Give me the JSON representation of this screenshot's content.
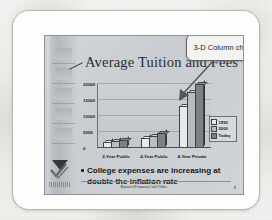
{
  "slide": {
    "title": "Average Tuition and Fees",
    "callout_label": "3-D Column chart",
    "bullet": "College expenses are increasing at double the inflation rate",
    "footer": "Bursar's/Financial Aid Office",
    "slide_number": "3",
    "logo_caption": "XYZ0001"
  },
  "colors": {
    "slide_bg": "#cdd0d4",
    "series_1993": "#e8e9ea",
    "series_2000": "#b9bcc0",
    "series_today": "#7d8084",
    "outline": "#3e4144",
    "frame_border": "#b9b7b3"
  },
  "chart_data": {
    "type": "bar",
    "title": "Average Tuition and Fees",
    "xlabel": "",
    "ylabel": "",
    "categories": [
      "2-Year Public",
      "4-Year Public",
      "4-Year Private"
    ],
    "series": [
      {
        "name": "1993",
        "values": [
          1100,
          2400,
          12500
        ]
      },
      {
        "name": "2000",
        "values": [
          1600,
          3200,
          17000
        ]
      },
      {
        "name": "Today",
        "values": [
          1900,
          4000,
          19500
        ]
      }
    ],
    "ylim": [
      0,
      20000
    ],
    "yticks": [
      0,
      5000,
      10000,
      15000,
      20000
    ],
    "ytick_labels": [
      "0",
      "5000",
      "10000",
      "15000",
      "20000"
    ],
    "grid": true,
    "legend_position": "right",
    "three_d": true,
    "annotations": [
      {
        "text": "3-D Column chart",
        "points_to": "tallest-column"
      }
    ]
  }
}
